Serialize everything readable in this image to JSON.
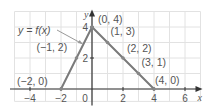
{
  "chart_data": {
    "type": "line",
    "title": "",
    "xlabel": "x",
    "ylabel": "y",
    "xlim": [
      -5,
      7
    ],
    "ylim": [
      -0.8,
      5
    ],
    "grid": true,
    "x_ticks": [
      -4,
      -2,
      0,
      2,
      4,
      6
    ],
    "x_tick_labels": [
      "−4",
      "−2",
      "0",
      "2",
      "4",
      "6"
    ],
    "y_ticks": [
      2,
      4
    ],
    "y_tick_labels": [
      "2",
      "4"
    ],
    "series": [
      {
        "name": "y = f(x)",
        "x": [
          -2,
          -1,
          0,
          1,
          2,
          3,
          4
        ],
        "y": [
          0,
          2,
          4,
          3,
          2,
          1,
          0
        ]
      }
    ],
    "point_labels": [
      {
        "x": -2,
        "y": 0,
        "text": "(−2, 0)"
      },
      {
        "x": -1,
        "y": 2,
        "text": "(−1, 2)"
      },
      {
        "x": 0,
        "y": 4,
        "text": "(0, 4)"
      },
      {
        "x": 1,
        "y": 3,
        "text": "(1, 3)"
      },
      {
        "x": 2,
        "y": 2,
        "text": "(2, 2)"
      },
      {
        "x": 3,
        "y": 1,
        "text": "(3, 1)"
      },
      {
        "x": 4,
        "y": 0,
        "text": "(4, 0)"
      }
    ],
    "annotations": [
      {
        "text": "y = f(x)",
        "points_to": {
          "x": -0.6,
          "y": 2.9
        }
      }
    ],
    "colors": {
      "line": "#7a7a7a",
      "axis": "#333333",
      "grid": "#e2e2e2",
      "text": "#555555"
    }
  }
}
